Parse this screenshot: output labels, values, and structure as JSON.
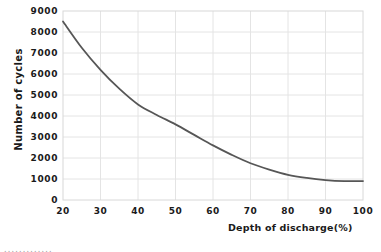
{
  "chart_data": {
    "type": "line",
    "title": "",
    "subtitle": "",
    "xlabel": "Depth of discharge(%)",
    "ylabel": "Number of cycles",
    "xlim": [
      20,
      100
    ],
    "ylim": [
      0,
      9000
    ],
    "grid": true,
    "legend": null,
    "x_ticks": [
      20,
      30,
      40,
      50,
      60,
      70,
      80,
      90,
      100
    ],
    "x_tick_labels": [
      "20",
      "30",
      "40",
      "50",
      "60",
      "70",
      "80",
      "90",
      "100"
    ],
    "y_ticks": [
      0,
      1000,
      2000,
      3000,
      4000,
      5000,
      6000,
      7000,
      8000,
      9000
    ],
    "y_tick_labels": [
      "0",
      "1000",
      "2000",
      "3000",
      "4000",
      "5000",
      "6000",
      "7000",
      "8000",
      "9000"
    ],
    "series": [
      {
        "name": "Cycle life vs depth of discharge",
        "color": "#565656",
        "line_width": 1.8,
        "x": [
          20,
          25,
          30,
          35,
          40,
          45,
          50,
          55,
          60,
          65,
          70,
          75,
          80,
          85,
          90,
          95,
          100
        ],
        "values": [
          8500,
          7250,
          6200,
          5300,
          4550,
          4050,
          3600,
          3100,
          2600,
          2150,
          1750,
          1450,
          1200,
          1050,
          950,
          900,
          900
        ]
      }
    ]
  },
  "axes": {
    "grid_color": "#e4e4e4",
    "frame_color": "#d8d8d8",
    "text_color": "#1a1a1a",
    "background": "#ffffff"
  },
  "caption": {
    "clipped_line": "............."
  }
}
